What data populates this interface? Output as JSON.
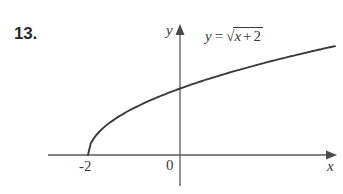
{
  "figure": {
    "problem_number": "13.",
    "background_color": "#ffffff",
    "curve_color": "#3a3a3a",
    "axis_color": "#5a5a5a"
  },
  "labels": {
    "y_axis": "y",
    "x_axis": "x",
    "origin": "0",
    "x_intercept": "-2"
  },
  "equation": {
    "lhs": "y",
    "equals": "=",
    "radical_sign": "√",
    "radicand_variable": "x",
    "radicand_operator": "+",
    "radicand_constant": "2",
    "full_text": "y = √(x + 2)"
  },
  "chart_data": {
    "type": "line",
    "title": "",
    "subtitle": "",
    "xlabel": "x",
    "ylabel": "y",
    "annotations": [
      "y = √(x + 2)"
    ],
    "grid": false,
    "legend": "none",
    "xlim": [
      -2.85,
      3.37
    ],
    "ylim": [
      -0.64,
      2.77
    ],
    "xticks": [
      -2,
      0
    ],
    "xticklabels": [
      "-2",
      "0"
    ],
    "yticks": [],
    "yticklabels": [],
    "series": [
      {
        "name": "y = sqrt(x + 2)",
        "x": [
          -2,
          -1.9,
          -1.75,
          -1.5,
          -1.25,
          -1,
          -0.5,
          0,
          0.5,
          1,
          1.5,
          2,
          2.5,
          3,
          3.3
        ],
        "y": [
          0,
          0.316,
          0.5,
          0.707,
          0.866,
          1,
          1.225,
          1.414,
          1.581,
          1.732,
          1.871,
          2,
          2.121,
          2.236,
          2.302
        ]
      }
    ]
  }
}
